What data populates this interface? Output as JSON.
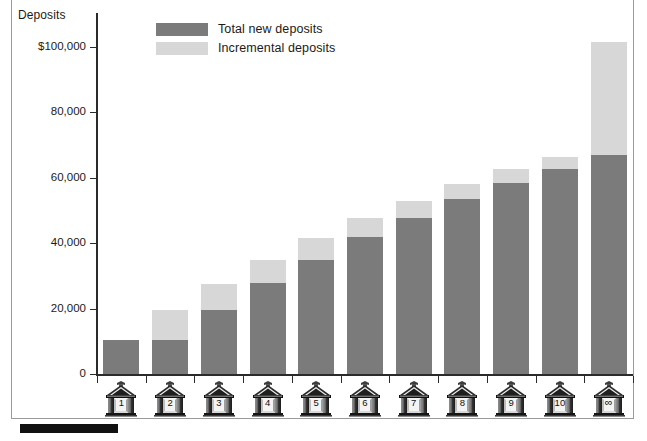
{
  "axis": {
    "y_title": "Deposits",
    "y_ticks": [
      "0",
      "20,000",
      "40,000",
      "60,000",
      "80,000",
      "$100,000"
    ]
  },
  "legend": {
    "items": [
      {
        "label": "Total new deposits",
        "color": "#7b7b7b",
        "key": "total"
      },
      {
        "label": "Incremental deposits",
        "color": "#d7d7d7",
        "key": "incremental"
      }
    ]
  },
  "x_labels": [
    "1",
    "2",
    "3",
    "4",
    "5",
    "6",
    "7",
    "8",
    "9",
    "10",
    "∞"
  ],
  "chart_data": {
    "type": "bar",
    "title": "",
    "subtitle": "",
    "xlabel": "",
    "ylabel": "Deposits",
    "ylim": [
      0,
      110000
    ],
    "yticks": [
      0,
      20000,
      40000,
      60000,
      80000,
      100000
    ],
    "ytick_labels": [
      "0",
      "20,000",
      "40,000",
      "60,000",
      "80,000",
      "$100,000"
    ],
    "grid": false,
    "stacked": true,
    "legend_position": "top-center",
    "categories": [
      "1",
      "2",
      "3",
      "4",
      "5",
      "6",
      "7",
      "8",
      "9",
      "10",
      "∞"
    ],
    "series": [
      {
        "name": "Total new deposits",
        "color": "#7b7b7b",
        "values": [
          10400,
          10400,
          19600,
          27800,
          35000,
          41800,
          47800,
          53500,
          58300,
          62800,
          67000
        ]
      },
      {
        "name": "Incremental deposits",
        "color": "#d7d7d7",
        "values": [
          0,
          9200,
          7900,
          7100,
          6700,
          5800,
          5000,
          4700,
          4400,
          3700,
          34500
        ]
      }
    ],
    "cumulative_totals": [
      10400,
      19600,
      27500,
      34900,
      41700,
      47600,
      52800,
      58200,
      62700,
      66500,
      101500
    ]
  },
  "colors": {
    "total": "#7b7b7b",
    "incremental": "#d7d7d7",
    "axis": "#2b2b2b",
    "frame": "#9a9a9a",
    "rule": "#111111"
  }
}
